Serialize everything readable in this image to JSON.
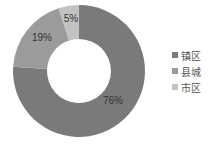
{
  "chart_data": {
    "type": "pie",
    "subtype": "donut",
    "title": "",
    "categories": [
      "镇区",
      "县城",
      "市区"
    ],
    "values": [
      76,
      19,
      5
    ],
    "labels": [
      "76%",
      "19%",
      "5%"
    ],
    "colors": [
      "#7a7a7a",
      "#9b9b9b",
      "#c2c2c2"
    ],
    "legend_position": "right",
    "start_angle_deg": 0,
    "direction": "clockwise"
  },
  "legend": {
    "items": [
      {
        "label": "镇区",
        "color": "#7a7a7a"
      },
      {
        "label": "县城",
        "color": "#9b9b9b"
      },
      {
        "label": "市区",
        "color": "#c2c2c2"
      }
    ]
  }
}
